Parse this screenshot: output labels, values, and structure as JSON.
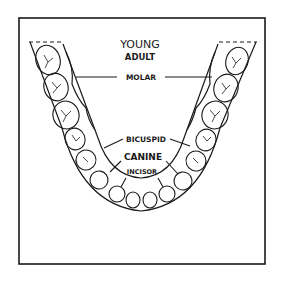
{
  "diagram": {
    "title_line1": "YOUNG",
    "title_line2": "ADULT",
    "labels": {
      "molar": "MOLAR",
      "bicuspid": "BICUSPID",
      "canine": "CANINE",
      "incisor": "INCISOR"
    },
    "colors": {
      "ink": "#1a1a1a",
      "background": "#ffffff"
    }
  }
}
